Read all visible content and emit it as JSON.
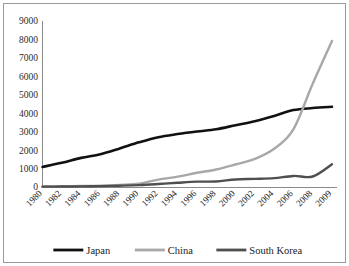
{
  "figure": {
    "border_color": "#9a9a9a",
    "background": "#ffffff"
  },
  "chart_data": {
    "type": "line",
    "title": "",
    "subtitle": "",
    "xlabel": "",
    "ylabel": "",
    "grid": false,
    "legend_position": "bottom",
    "axis_color": "#8a8a8a",
    "ylim": [
      0,
      9000
    ],
    "ytick_values": [
      9000,
      8000,
      7000,
      6000,
      5000,
      4000,
      3000,
      2000,
      1000,
      0
    ],
    "ytick_labels": [
      "9000",
      "8000",
      "7000",
      "6000",
      "5000",
      "4000",
      "3000",
      "2000",
      "1000",
      "0"
    ],
    "categories": [
      "1980",
      "1982",
      "1984",
      "1986",
      "1988",
      "1990",
      "1992",
      "1994",
      "1996",
      "1998",
      "2000",
      "2002",
      "2004",
      "2006",
      "2008",
      "2009"
    ],
    "x": [
      1980,
      1982,
      1984,
      1986,
      1988,
      1990,
      1992,
      1994,
      1996,
      1998,
      2000,
      2002,
      2004,
      2006,
      2008,
      2009
    ],
    "series": [
      {
        "name": "Japan",
        "color": "#111111",
        "width": 2.6,
        "values": [
          1090,
          1310,
          1580,
          1780,
          2090,
          2420,
          2700,
          2870,
          3010,
          3130,
          3350,
          3570,
          3850,
          4170,
          4280,
          4350
        ]
      },
      {
        "name": "China",
        "color": "#a8a8a8",
        "width": 2.4,
        "values": [
          30,
          40,
          55,
          70,
          110,
          180,
          400,
          560,
          770,
          950,
          1220,
          1520,
          2070,
          3130,
          5600,
          7920
        ]
      },
      {
        "name": "South Korea",
        "color": "#4f4f4f",
        "width": 2.4,
        "values": [
          20,
          25,
          35,
          50,
          70,
          100,
          160,
          230,
          290,
          300,
          410,
          440,
          480,
          600,
          570,
          1230
        ]
      }
    ]
  },
  "legend": {
    "items": [
      {
        "label": "Japan",
        "color": "#111111"
      },
      {
        "label": "China",
        "color": "#a8a8a8"
      },
      {
        "label": "South Korea",
        "color": "#4f4f4f"
      }
    ]
  }
}
